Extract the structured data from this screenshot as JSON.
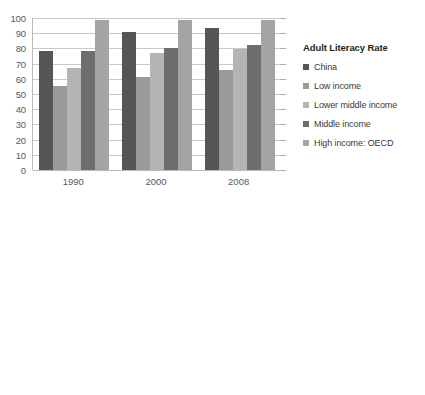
{
  "palette": {
    "china": "#565656",
    "low_income": "#9a9a9a",
    "lower_middle_income": "#b4b4b4",
    "middle_income": "#6e6e6e",
    "high_income_oecd": "#a4a4a4",
    "gridline": "#c9c9c9",
    "axis": "#b9b9b9",
    "text": "#3b3b3b",
    "background": "#ffffff"
  },
  "charts": [
    {
      "id": "literacy",
      "legend_title": "Adult Literacy Rate",
      "chart_data": {
        "type": "bar",
        "title": "Adult Literacy Rate",
        "xlabel": "",
        "ylabel": "",
        "ylim": [
          0,
          100
        ],
        "yticks": [
          0,
          10,
          20,
          30,
          40,
          50,
          60,
          70,
          80,
          90,
          100
        ],
        "grid": true,
        "legend_position": "right",
        "categories": [
          "1990",
          "2000",
          "2008"
        ],
        "series": [
          {
            "name": "China",
            "color": "#565656",
            "values": [
              78.0,
              91.0,
              93.5
            ]
          },
          {
            "name": "Low income",
            "color": "#9a9a9a",
            "values": [
              55.0,
              61.5,
              65.5
            ]
          },
          {
            "name": "Lower middle income",
            "color": "#b4b4b4",
            "values": [
              67.0,
              77.0,
              79.5
            ]
          },
          {
            "name": "Middle income",
            "color": "#6e6e6e",
            "values": [
              78.5,
              80.5,
              82.5
            ]
          },
          {
            "name": "High income: OECD",
            "color": "#a4a4a4",
            "values": [
              98.5,
              98.5,
              98.5
            ]
          }
        ]
      }
    },
    {
      "id": "life-expectancy",
      "legend_title": "Life Expectancy at Birth",
      "chart_data": {
        "type": "bar",
        "title": "Life Expectancy at Birth",
        "xlabel": "",
        "ylabel": "",
        "ylim": [
          0,
          100
        ],
        "yticks": [
          0,
          10,
          20,
          30,
          40,
          50,
          60,
          70,
          80,
          90,
          100
        ],
        "grid": true,
        "legend_position": "right",
        "categories": [
          "1982",
          "1990",
          "2000",
          "2008"
        ],
        "series": [
          {
            "name": "China",
            "color": "#565656",
            "values": [
              66.0,
              68.0,
              71.0,
              72.5
            ]
          },
          {
            "name": "Low income",
            "color": "#9a9a9a",
            "values": [
              49.5,
              52.0,
              54.0,
              56.5
            ]
          },
          {
            "name": "Lower middle income",
            "color": "#b4b4b4",
            "values": [
              60.0,
              62.5,
              65.5,
              67.0
            ]
          },
          {
            "name": "Middle income",
            "color": "#6e6e6e",
            "values": [
              61.5,
              64.0,
              66.5,
              68.0
            ]
          },
          {
            "name": "High income: OECD",
            "color": "#a4a4a4",
            "values": [
              74.0,
              75.5,
              77.5,
              79.5
            ]
          }
        ]
      }
    }
  ]
}
